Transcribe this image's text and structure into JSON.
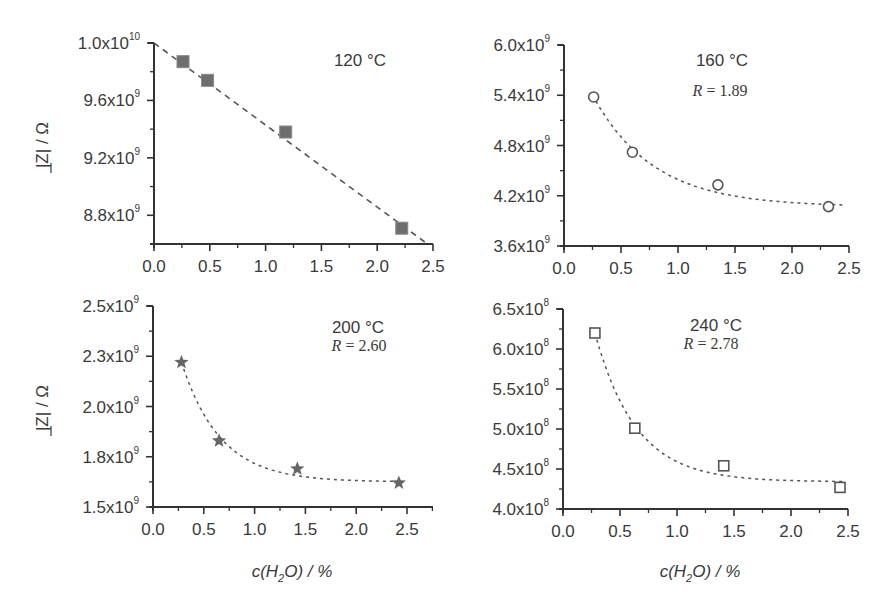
{
  "figure": {
    "y_axis_title": "|Z| / Ω",
    "x_axis_title": "c(H2O) / %",
    "x_axis_title_parts": {
      "pre": "c(H",
      "sub": "2",
      "post": "O) / %"
    },
    "colors": {
      "axis": "#333333",
      "marker": "#555555",
      "marker_fill_square": "#6e6e6e",
      "fit_line": "#555555",
      "text": "#3a3a3a"
    }
  },
  "chart_data": [
    {
      "type": "scatter",
      "panel": "top-left",
      "title": "120 °C",
      "annotation": "",
      "xlabel": "",
      "ylabel": "|Z| / Ω",
      "xlim": [
        0.0,
        2.5
      ],
      "ylim": [
        8600000000.0,
        10000000000.0
      ],
      "xticks": [
        0.0,
        0.5,
        1.0,
        1.5,
        2.0,
        2.5
      ],
      "xtick_labels": [
        "0.0",
        "0.5",
        "1.0",
        "1.5",
        "2.0",
        "2.5"
      ],
      "yticks": [
        10000000000.0,
        9600000000.0,
        9200000000.0,
        8800000000.0
      ],
      "ytick_labels": [
        {
          "m": "1.0x10",
          "e": "10"
        },
        {
          "m": "9.6x10",
          "e": "9"
        },
        {
          "m": "9.2x10",
          "e": "9"
        },
        {
          "m": "8.8x10",
          "e": "9"
        }
      ],
      "marker": "filled-square",
      "fit": "linear",
      "series": [
        {
          "name": "120 °C",
          "x": [
            0.26,
            0.48,
            1.18,
            2.22
          ],
          "y": [
            9870000000.0,
            9740000000.0,
            9380000000.0,
            8710000000.0
          ]
        }
      ],
      "fit_line": {
        "x": [
          0.0,
          2.45
        ],
        "y": [
          10000000000.0,
          8600000000.0
        ]
      },
      "grid": false,
      "box": {
        "x0": 154,
        "x1": 433,
        "y0": 43,
        "y1": 244,
        "xaxis_end": 433
      }
    },
    {
      "type": "scatter",
      "panel": "top-right",
      "title": "160 °C",
      "annotation": "R = 1.89",
      "xlabel": "",
      "ylabel": "",
      "xlim": [
        0.0,
        2.5
      ],
      "ylim": [
        3600000000.0,
        6000000000.0
      ],
      "xticks": [
        0.0,
        0.5,
        1.0,
        1.5,
        2.0,
        2.5
      ],
      "xtick_labels": [
        "0.0",
        "0.5",
        "1.0",
        "1.5",
        "2.0",
        "2.5"
      ],
      "yticks": [
        6000000000.0,
        5400000000.0,
        4800000000.0,
        4200000000.0,
        3600000000.0
      ],
      "ytick_labels": [
        {
          "m": "6.0x10",
          "e": "9"
        },
        {
          "m": "5.4x10",
          "e": "9"
        },
        {
          "m": "4.8x10",
          "e": "9"
        },
        {
          "m": "4.2x10",
          "e": "9"
        },
        {
          "m": "3.6x10",
          "e": "9"
        }
      ],
      "marker": "open-circle",
      "fit": "exponential-decay",
      "series": [
        {
          "name": "160 °C",
          "x": [
            0.26,
            0.6,
            1.35,
            2.32
          ],
          "y": [
            5380000000.0,
            4720000000.0,
            4330000000.0,
            4070000000.0
          ]
        }
      ],
      "fit_curve": {
        "x0": 0.3,
        "x1": 2.45,
        "y_inf": 4070000000.0,
        "a": 1700000000.0,
        "k": 1.89
      },
      "grid": false,
      "box": {
        "x0": 564,
        "x1": 849,
        "y0": 45,
        "y1": 246,
        "xaxis_end": 849
      }
    },
    {
      "type": "scatter",
      "panel": "bottom-left",
      "title": "200 °C",
      "annotation": "R = 2.60",
      "xlabel": "c(H2O) / %",
      "ylabel": "|Z| / Ω",
      "xlim": [
        0.0,
        2.75
      ],
      "ylim": [
        1500000000.0,
        2500000000.0
      ],
      "xticks": [
        0.0,
        0.5,
        1.0,
        1.5,
        2.0,
        2.5
      ],
      "xtick_labels": [
        "0.0",
        "0.5",
        "1.0",
        "1.5",
        "2.0",
        "2.5"
      ],
      "yticks": [
        2500000000.0,
        2250000000.0,
        2000000000.0,
        1750000000.0,
        1500000000.0
      ],
      "ytick_labels": [
        {
          "m": "2.5x10",
          "e": "9"
        },
        {
          "m": "2.3x10",
          "e": "9"
        },
        {
          "m": "2.0x10",
          "e": "9"
        },
        {
          "m": "1.8x10",
          "e": "9"
        },
        {
          "m": "1.5x10",
          "e": "9"
        }
      ],
      "marker": "filled-star",
      "fit": "exponential-decay",
      "series": [
        {
          "name": "200 °C",
          "x": [
            0.28,
            0.65,
            1.42,
            2.42
          ],
          "y": [
            2220000000.0,
            1830000000.0,
            1690000000.0,
            1620000000.0
          ]
        }
      ],
      "fit_curve": {
        "x0": 0.3,
        "x1": 2.42,
        "y_inf": 1625000000.0,
        "a": 1200000000.0,
        "k": 2.6
      },
      "grid": false,
      "box": {
        "x0": 153,
        "x1": 433,
        "y0": 306,
        "y1": 507,
        "xaxis_end": 433
      }
    },
    {
      "type": "scatter",
      "panel": "bottom-right",
      "title": "240 °C",
      "annotation": "R = 2.78",
      "xlabel": "c(H2O) / %",
      "ylabel": "",
      "xlim": [
        0.0,
        2.5
      ],
      "ylim": [
        400000000.0,
        650000000.0
      ],
      "xticks": [
        0.0,
        0.5,
        1.0,
        1.5,
        2.0,
        2.5
      ],
      "xtick_labels": [
        "0.0",
        "0.5",
        "1.0",
        "1.5",
        "2.0",
        "2.5"
      ],
      "yticks": [
        650000000.0,
        600000000.0,
        550000000.0,
        500000000.0,
        450000000.0,
        400000000.0
      ],
      "ytick_labels": [
        {
          "m": "6.5x10",
          "e": "8"
        },
        {
          "m": "6.0x10",
          "e": "8"
        },
        {
          "m": "5.5x10",
          "e": "8"
        },
        {
          "m": "5.0x10",
          "e": "8"
        },
        {
          "m": "4.5x10",
          "e": "8"
        },
        {
          "m": "4.0x10",
          "e": "8"
        }
      ],
      "marker": "open-square",
      "fit": "exponential-decay",
      "series": [
        {
          "name": "240 °C",
          "x": [
            0.28,
            0.63,
            1.41,
            2.43
          ],
          "y": [
            620000000.0,
            501000000.0,
            454000000.0,
            427000000.0
          ]
        }
      ],
      "fit_curve": {
        "x0": 0.3,
        "x1": 2.45,
        "y_inf": 434000000.0,
        "a": 390000000.0,
        "k": 2.78
      },
      "grid": false,
      "box": {
        "x0": 563,
        "x1": 848,
        "y0": 309,
        "y1": 509,
        "xaxis_end": 848
      }
    }
  ]
}
